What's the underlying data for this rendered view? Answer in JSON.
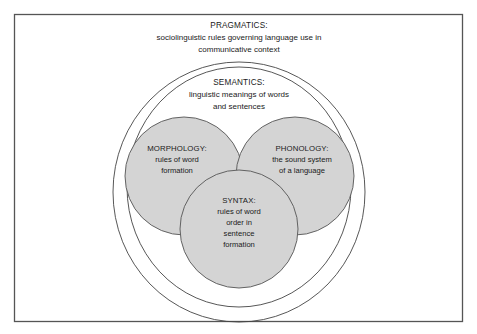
{
  "diagram": {
    "title_text": "",
    "frame": {
      "border_color": "#555555",
      "background": "#ffffff"
    },
    "colors": {
      "circle_fill": "#d4d4d4",
      "circle_stroke": "#555555",
      "ellipse_stroke": "#444444",
      "text": "#1a1a1a",
      "frame_border": "#555555"
    },
    "layers": {
      "pragmatics": {
        "label": "PRAGMATICS:",
        "description_lines": [
          "sociolinguistic rules governing language use in",
          "communicative context"
        ]
      },
      "semantics": {
        "label": "SEMANTICS:",
        "description_lines": [
          "linguistic meanings of words",
          "and sentences"
        ]
      }
    },
    "circles": [
      {
        "name": "morphology",
        "label": "MORPHOLOGY:",
        "description_lines": [
          "rules of word",
          "formation"
        ]
      },
      {
        "name": "phonology",
        "label": "PHONOLOGY:",
        "description_lines": [
          "the sound system",
          "of a language"
        ]
      },
      {
        "name": "syntax",
        "label": "SYNTAX:",
        "description_lines": [
          "rules of word",
          "order in",
          "sentence",
          "formation"
        ]
      }
    ]
  }
}
